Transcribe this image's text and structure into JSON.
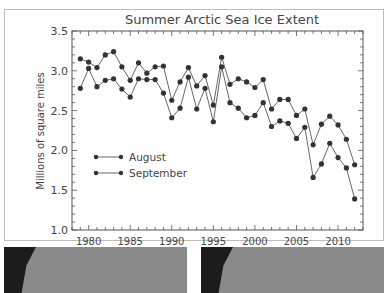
{
  "chart_data": {
    "type": "line",
    "title": "Summer Arctic Sea Ice Extent",
    "xlabel": "Year",
    "ylabel": "Millions of square miles",
    "xlim": [
      1978,
      2013
    ],
    "ylim": [
      1.0,
      3.5
    ],
    "xticks": [
      1980,
      1985,
      1990,
      1995,
      2000,
      2005,
      2010
    ],
    "yticks": [
      "1.0",
      "1.5",
      "2.0",
      "2.5",
      "3.0",
      "3.5"
    ],
    "grid": false,
    "legend_position": "center-left",
    "x": [
      1979,
      1980,
      1981,
      1982,
      1983,
      1984,
      1985,
      1986,
      1987,
      1988,
      1989,
      1990,
      1991,
      1992,
      1993,
      1994,
      1995,
      1996,
      1997,
      1998,
      1999,
      2000,
      2001,
      2002,
      2003,
      2004,
      2005,
      2006,
      2007,
      2008,
      2009,
      2010,
      2011,
      2012
    ],
    "series": [
      {
        "name": "August",
        "values": [
          3.15,
          3.11,
          3.04,
          3.2,
          3.24,
          3.05,
          2.88,
          3.1,
          2.97,
          3.05,
          3.06,
          2.63,
          2.86,
          3.04,
          2.81,
          2.94,
          2.57,
          3.17,
          2.83,
          2.9,
          2.86,
          2.79,
          2.89,
          2.52,
          2.64,
          2.64,
          2.44,
          2.52,
          2.07,
          2.33,
          2.43,
          2.32,
          2.14,
          1.82
        ]
      },
      {
        "name": "September",
        "values": [
          2.78,
          3.03,
          2.8,
          2.88,
          2.9,
          2.77,
          2.67,
          2.9,
          2.89,
          2.89,
          2.72,
          2.41,
          2.53,
          2.92,
          2.52,
          2.78,
          2.36,
          3.05,
          2.6,
          2.53,
          2.41,
          2.44,
          2.6,
          2.3,
          2.37,
          2.34,
          2.15,
          2.29,
          1.66,
          1.83,
          2.09,
          1.91,
          1.78,
          1.39
        ]
      }
    ]
  },
  "colors": {
    "line": "#555555",
    "marker": "#333333",
    "axis": "#555555",
    "text": "#444444"
  }
}
